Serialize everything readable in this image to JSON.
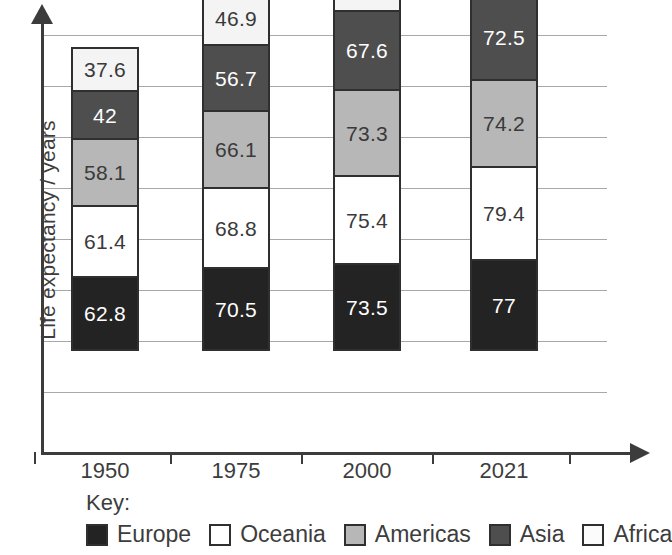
{
  "chart_data": {
    "type": "bar",
    "subtype": "stacked-bar",
    "title": "",
    "xlabel": "",
    "ylabel": "Life expectancy / years",
    "categories": [
      "1950",
      "1975",
      "2000",
      "2021"
    ],
    "grid": true,
    "gridlines": 8,
    "legend_position": "bottom",
    "key_label": "Key:",
    "stack_order_bottom_to_top": [
      "Europe",
      "Oceania",
      "Americas",
      "Asia",
      "Africa"
    ],
    "series": [
      {
        "name": "Europe",
        "color": "#232323",
        "text_color": "#ffffff",
        "values": [
          62.8,
          70.5,
          73.5,
          77
        ],
        "labels": [
          "62.8",
          "70.5",
          "73.5",
          "77"
        ]
      },
      {
        "name": "Oceania",
        "color": "#ffffff",
        "text_color": "#3a3a3a",
        "values": [
          61.4,
          68.8,
          75.4,
          79.4
        ],
        "labels": [
          "61.4",
          "68.8",
          "75.4",
          "79.4"
        ]
      },
      {
        "name": "Americas",
        "color": "#b7b7b7",
        "text_color": "#3a3a3a",
        "values": [
          58.1,
          66.1,
          73.3,
          74.2
        ],
        "labels": [
          "58.1",
          "66.1",
          "73.3",
          "74.2"
        ]
      },
      {
        "name": "Asia",
        "color": "#4e4e4e",
        "text_color": "#ffffff",
        "values": [
          42,
          56.7,
          67.6,
          72.5
        ],
        "labels": [
          "42",
          "56.7",
          "67.6",
          "72.5"
        ]
      },
      {
        "name": "Africa",
        "color": "#f4f4f4",
        "text_color": "#3a3a3a",
        "values": [
          37.6,
          46.9,
          53.3,
          61.7
        ],
        "labels": [
          "37.6",
          "46.9",
          "53.3",
          "61.7"
        ]
      }
    ]
  },
  "axis": {
    "y_title": "Life expectancy / years",
    "x_ticks": [
      "1950",
      "1975",
      "2000",
      "2021"
    ]
  },
  "key": {
    "title": "Key:",
    "items": [
      {
        "label": "Europe",
        "color": "#232323"
      },
      {
        "label": "Oceania",
        "color": "#ffffff"
      },
      {
        "label": "Americas",
        "color": "#b7b7b7"
      },
      {
        "label": "Asia",
        "color": "#4e4e4e"
      },
      {
        "label": "Africa",
        "color": "#fbfbfb"
      }
    ]
  }
}
